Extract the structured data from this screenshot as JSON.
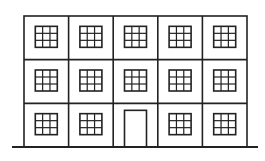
{
  "diagram": {
    "type": "building-facade",
    "stroke_color": "#222222",
    "background": "#ffffff",
    "building": {
      "x": 24,
      "y": 16,
      "width": 223,
      "height": 131
    },
    "ground": {
      "x1": 12,
      "x2": 258,
      "y": 147
    },
    "columns": 5,
    "rows": 3,
    "window_grid": "3x3",
    "door": {
      "row": 3,
      "column": 3
    },
    "window_count": 14
  }
}
